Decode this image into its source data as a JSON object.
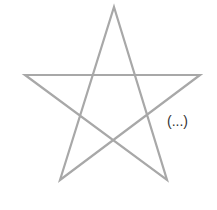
{
  "diagram": {
    "shape": "pentagram",
    "stroke_color": "#a8a8a8",
    "stroke_width": 2.2,
    "vertices": [
      [
        114,
        7
      ],
      [
        167,
        180
      ],
      [
        25,
        75
      ],
      [
        200,
        75
      ],
      [
        60,
        180
      ]
    ],
    "annotation": "(...)",
    "annotation_color": "#333333"
  }
}
